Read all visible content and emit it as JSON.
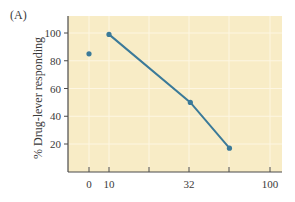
{
  "panel_label": "(A)",
  "colors": {
    "plot_background": "#f8ecc6",
    "gridline": "#fdf6e2",
    "axis": "#4a4a4a",
    "series": "#3b7a99"
  },
  "chart_data": {
    "type": "line",
    "title": "",
    "panel": "(A)",
    "xlabel": "",
    "ylabel": "% Drug-lever responding",
    "x_scale": "log-like (half-log steps), with separate 0 control position",
    "x_ticks": [
      {
        "label": "0",
        "pos": 89
      },
      {
        "label": "10",
        "pos": 109
      },
      {
        "label": "",
        "pos": 149
      },
      {
        "label": "32",
        "pos": 189
      },
      {
        "label": "",
        "pos": 229
      },
      {
        "label": "100",
        "pos": 270
      }
    ],
    "y_ticks": [
      20,
      40,
      60,
      80,
      100
    ],
    "ylim": [
      0,
      112
    ],
    "grid": true,
    "legend": null,
    "series": [
      {
        "name": "control (dose 0)",
        "connected": false,
        "points": [
          {
            "x": 0,
            "y": 85
          }
        ]
      },
      {
        "name": "dose-response",
        "connected": true,
        "points": [
          {
            "x": 10,
            "y": 99
          },
          {
            "x": 32,
            "y": 50
          },
          {
            "x": 56,
            "y": 17
          }
        ]
      }
    ]
  }
}
